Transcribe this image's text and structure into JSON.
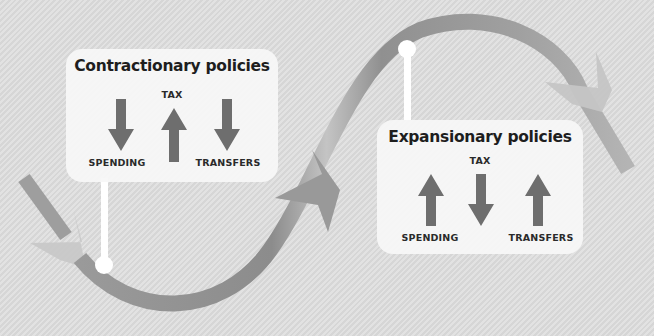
{
  "diagram": {
    "type": "business-cycle-wave",
    "colors": {
      "background": "#dcdcdc",
      "wave": "#8f8f8f",
      "wave_light": "#c9c9c9",
      "arrow": "#6e6e6e",
      "panel": "#f7f7f7",
      "text": "#1e1e1e"
    },
    "contractionary": {
      "title": "Contractionary policies",
      "items": [
        {
          "label": "SPENDING",
          "direction": "down",
          "icon": "arrow-down-icon"
        },
        {
          "label": "TAX",
          "direction": "up",
          "icon": "arrow-up-icon"
        },
        {
          "label": "TRANSFERS",
          "direction": "down",
          "icon": "arrow-down-icon"
        }
      ]
    },
    "expansionary": {
      "title": "Expansionary policies",
      "items": [
        {
          "label": "SPENDING",
          "direction": "up",
          "icon": "arrow-up-icon"
        },
        {
          "label": "TAX",
          "direction": "down",
          "icon": "arrow-down-icon"
        },
        {
          "label": "TRANSFERS",
          "direction": "up",
          "icon": "arrow-up-icon"
        }
      ]
    }
  }
}
